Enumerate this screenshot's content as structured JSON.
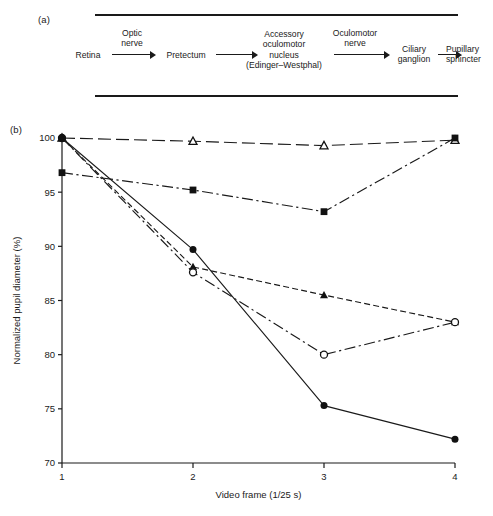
{
  "figure": {
    "panel_a": {
      "label": "(a)",
      "nodes": [
        {
          "id": "retina",
          "lines": [
            "Retina"
          ]
        },
        {
          "id": "pretectum",
          "lines": [
            "Pretectum"
          ]
        },
        {
          "id": "accessory-oculomotor-nucleus",
          "lines": [
            "Accessory",
            "oculomotor",
            "nucleus",
            "(Edinger–Westphal)"
          ]
        },
        {
          "id": "ciliary-ganglion",
          "lines": [
            "Ciliary",
            "ganglion"
          ]
        },
        {
          "id": "pupillary-sphincter",
          "lines": [
            "Pupillary",
            "sphincter"
          ]
        }
      ],
      "arrow_captions": [
        {
          "id": "optic-nerve",
          "lines": [
            "Optic",
            "nerve"
          ]
        },
        {
          "id": "oculomotor-nerve",
          "lines": [
            "Oculomotor",
            "nerve"
          ]
        }
      ]
    },
    "panel_b": {
      "label": "(b)"
    }
  },
  "chart_data": {
    "type": "line",
    "title": "",
    "xlabel": "Video frame (1/25 s)",
    "ylabel": "Normalized pupil diameter (%)",
    "x": [
      1,
      2,
      3,
      4
    ],
    "xticklabels": [
      "1",
      "2",
      "3",
      "4"
    ],
    "yticks": [
      70,
      75,
      80,
      85,
      90,
      95,
      100
    ],
    "yticklabels": [
      "70",
      "75",
      "80",
      "85",
      "90",
      "95",
      "100"
    ],
    "xlim": [
      1,
      4
    ],
    "ylim": [
      70,
      100
    ],
    "grid": false,
    "legend": "none",
    "series": [
      {
        "name": "series-open-triangle",
        "marker": "open-triangle",
        "linestyle": "long-dash",
        "values": [
          100.0,
          99.7,
          99.3,
          99.8
        ]
      },
      {
        "name": "series-filled-square",
        "marker": "filled-square",
        "linestyle": "dash-dot",
        "values": [
          96.8,
          95.2,
          93.2,
          100.0
        ]
      },
      {
        "name": "series-filled-triangle",
        "marker": "filled-triangle",
        "linestyle": "dashed",
        "values": [
          100.0,
          88.1,
          85.5,
          83.0
        ]
      },
      {
        "name": "series-open-circle",
        "marker": "open-circle",
        "linestyle": "dash-dot",
        "values": [
          100.0,
          87.6,
          80.0,
          83.0
        ]
      },
      {
        "name": "series-filled-circle",
        "marker": "filled-circle",
        "linestyle": "solid",
        "values": [
          100.0,
          89.7,
          75.3,
          72.2
        ]
      }
    ]
  }
}
